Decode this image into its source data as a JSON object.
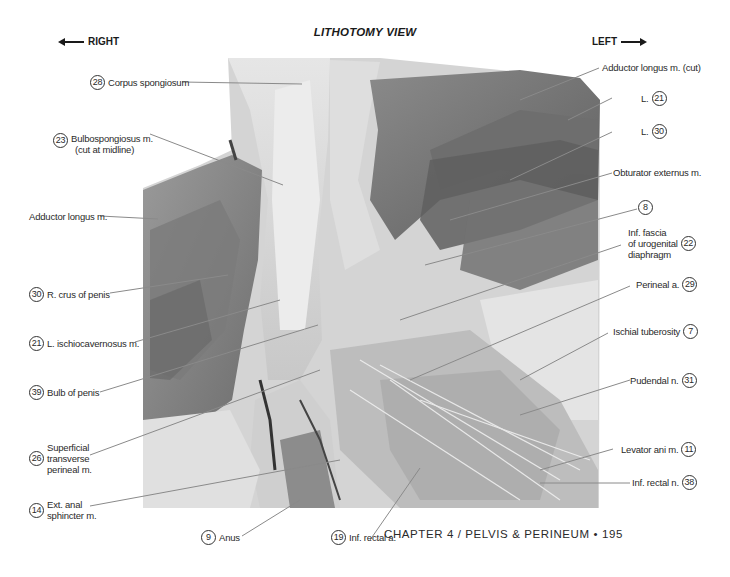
{
  "header": {
    "title": "LITHOTOMY VIEW",
    "right_direction": "RIGHT",
    "left_direction": "LEFT"
  },
  "labels_left": [
    {
      "num": "28",
      "text": "Corpus spongiosum"
    },
    {
      "num": "23",
      "text": "Bulbospongiosus m.",
      "text2": "(cut at midline)"
    },
    {
      "num": "",
      "text": "Adductor longus m."
    },
    {
      "num": "30",
      "text": "R. crus of penis"
    },
    {
      "num": "21",
      "text": "L. ischiocavernosus m."
    },
    {
      "num": "39",
      "text": "Bulb of penis"
    },
    {
      "num": "26",
      "text": "Superficial",
      "text2": "transverse",
      "text3": "perineal m."
    },
    {
      "num": "14",
      "text": "Ext. anal",
      "text2": "sphincter m."
    }
  ],
  "labels_bottom": [
    {
      "num": "9",
      "text": "Anus"
    },
    {
      "num": "19",
      "text": "Inf. rectal a."
    }
  ],
  "labels_right": [
    {
      "num": "",
      "text": "Adductor longus m. (cut)"
    },
    {
      "num": "21",
      "text": "L."
    },
    {
      "num": "30",
      "text": "L."
    },
    {
      "num": "",
      "text": "Obturator externus m."
    },
    {
      "num": "8",
      "text": ""
    },
    {
      "num": "22",
      "text": "Inf. fascia",
      "text2": "of urogenital",
      "text3": "diaphragm"
    },
    {
      "num": "29",
      "text": "Perineal a."
    },
    {
      "num": "7",
      "text": "Ischial tuberosity"
    },
    {
      "num": "31",
      "text": "Pudendal n."
    },
    {
      "num": "11",
      "text": "Levator ani m."
    },
    {
      "num": "38",
      "text": "Inf. rectal n."
    }
  ],
  "footer": {
    "text": "CHAPTER 4 / PELVIS & PERINEUM • 195"
  },
  "colors": {
    "leader_line": "#8a8a8a",
    "text": "#2a2a2a"
  }
}
